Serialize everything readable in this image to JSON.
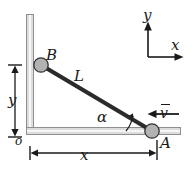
{
  "figure": {
    "labels": {
      "point_b": "B",
      "point_a": "A",
      "origin": "o",
      "rod_length": "L",
      "angle": "α",
      "velocity": "v",
      "dim_vertical": "y",
      "dim_horizontal": "x",
      "axis_y": "y",
      "axis_x": "x"
    },
    "colors": {
      "rod": "#2b2b2b",
      "slider_fill": "#b0b0b0",
      "slider_stroke": "#3a3a3a",
      "rail": "#d9d9d9",
      "rail_stroke": "#8c8c8c",
      "ink": "#1a1a1a",
      "background": "#ffffff"
    },
    "geometry": {
      "point_b": [
        41,
        65
      ],
      "point_a": [
        152,
        131
      ],
      "origin": [
        30,
        131
      ],
      "slider_radius": 7,
      "rail_vertical_top": [
        30,
        14
      ],
      "rail_horizontal_right": [
        181,
        131
      ],
      "dim_y_line_x": 15,
      "dim_y_from": 65,
      "dim_y_to": 137,
      "dim_x_line_y": 153,
      "dim_x_from": 30,
      "dim_x_to": 152,
      "axes_corner": [
        148,
        57
      ],
      "axes_y_tip": [
        148,
        22
      ],
      "axes_x_tip": [
        183,
        57
      ],
      "velocity_arrow_from": [
        178,
        114
      ],
      "velocity_arrow_to": [
        149,
        114
      ],
      "angle_arc_radius": 26
    }
  }
}
